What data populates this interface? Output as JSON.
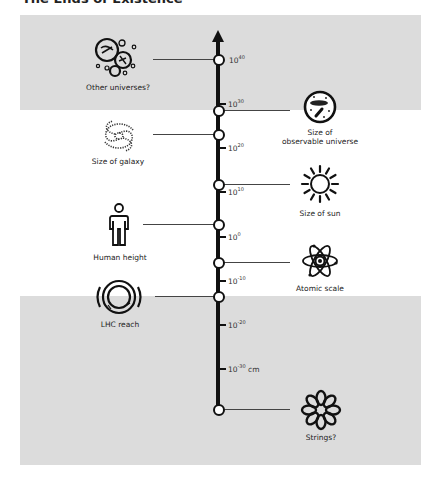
{
  "title": "The Ends of Existence",
  "colors": {
    "panel_gray": "#dcdcdc",
    "axis": "#111111",
    "background": "#ffffff"
  },
  "axis": {
    "unit": "cm",
    "direction": "up",
    "ticks": [
      {
        "base": "10",
        "exp": "40",
        "suffix": ""
      },
      {
        "base": "10",
        "exp": "30",
        "suffix": ""
      },
      {
        "base": "10",
        "exp": "20",
        "suffix": ""
      },
      {
        "base": "10",
        "exp": "10",
        "suffix": ""
      },
      {
        "base": "10",
        "exp": "0",
        "suffix": ""
      },
      {
        "base": "10",
        "exp": "-10",
        "suffix": ""
      },
      {
        "base": "10",
        "exp": "-20",
        "suffix": ""
      },
      {
        "base": "10",
        "exp": "-30",
        "suffix": " cm"
      }
    ]
  },
  "items": {
    "other_universes": {
      "label": "Other universes?",
      "side": "left",
      "icon": "bubble-universes-icon"
    },
    "observable_universe": {
      "label_line1": "Size of",
      "label_line2": "observable universe",
      "side": "right",
      "icon": "universe-icon"
    },
    "galaxy": {
      "label": "Size of galaxy",
      "side": "left",
      "icon": "spiral-galaxy-icon"
    },
    "sun": {
      "label": "Size of sun",
      "side": "right",
      "icon": "sun-icon"
    },
    "human": {
      "label": "Human height",
      "side": "left",
      "icon": "person-icon"
    },
    "atom": {
      "label": "Atomic scale",
      "side": "right",
      "icon": "atom-icon"
    },
    "lhc": {
      "label": "LHC reach",
      "side": "left",
      "icon": "collider-ring-icon"
    },
    "strings": {
      "label": "Strings?",
      "side": "right",
      "icon": "string-loop-icon"
    }
  }
}
